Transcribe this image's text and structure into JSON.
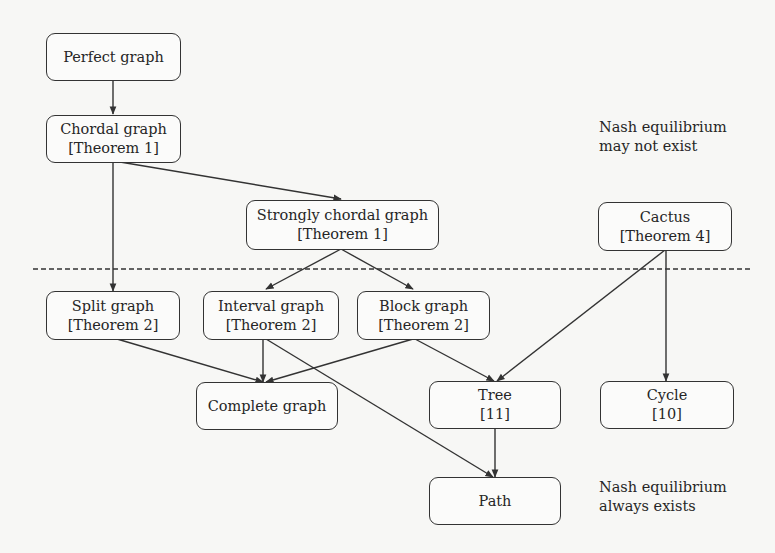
{
  "diagram": {
    "type": "graph-class hierarchy",
    "nodes": {
      "perfect": {
        "label": "Perfect graph"
      },
      "chordal": {
        "label": "Chordal graph",
        "ref": "[Theorem 1]"
      },
      "strongly": {
        "label": "Strongly chordal graph",
        "ref": "[Theorem 1]"
      },
      "cactus": {
        "label": "Cactus",
        "ref": "[Theorem 4]"
      },
      "split": {
        "label": "Split graph",
        "ref": "[Theorem 2]"
      },
      "interval": {
        "label": "Interval graph",
        "ref": "[Theorem 2]"
      },
      "block": {
        "label": "Block graph",
        "ref": "[Theorem 2]"
      },
      "complete": {
        "label": "Complete graph"
      },
      "tree": {
        "label": "Tree",
        "ref": "[11]"
      },
      "cycle": {
        "label": "Cycle",
        "ref": "[10]"
      },
      "path": {
        "label": "Path"
      }
    },
    "edges": [
      [
        "Perfect graph",
        "Chordal graph"
      ],
      [
        "Chordal graph",
        "Strongly chordal graph"
      ],
      [
        "Chordal graph",
        "Split graph"
      ],
      [
        "Strongly chordal graph",
        "Interval graph"
      ],
      [
        "Strongly chordal graph",
        "Block graph"
      ],
      [
        "Split graph",
        "Complete graph"
      ],
      [
        "Interval graph",
        "Complete graph"
      ],
      [
        "Block graph",
        "Complete graph"
      ],
      [
        "Interval graph",
        "Path"
      ],
      [
        "Block graph",
        "Tree"
      ],
      [
        "Cactus",
        "Tree"
      ],
      [
        "Cactus",
        "Cycle"
      ],
      [
        "Tree",
        "Path"
      ]
    ],
    "annotations": {
      "above": {
        "line1": "Nash equilibrium",
        "line2": "may not exist"
      },
      "below": {
        "line1": "Nash equilibrium",
        "line2": "always exists"
      }
    },
    "divider": "dashed"
  }
}
